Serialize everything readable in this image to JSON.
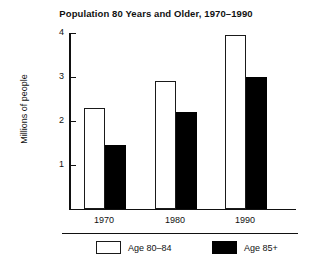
{
  "chart_data": {
    "type": "bar",
    "title": "Population 80 Years and Older, 1970–1990",
    "xlabel": "",
    "ylabel": "Millions of people",
    "categories": [
      "1970",
      "1980",
      "1990"
    ],
    "series": [
      {
        "name": "Age 80–84",
        "values": [
          2.3,
          2.9,
          3.95
        ],
        "color": "#ffffff",
        "edge_color": "#1a1a1a"
      },
      {
        "name": "Age 85+",
        "values": [
          1.45,
          2.2,
          3.0
        ],
        "color": "#000000",
        "edge_color": "#000000"
      }
    ],
    "ylim": [
      0,
      4
    ],
    "yticks": [
      1,
      2,
      3,
      4
    ],
    "ytick_labels": [
      "1",
      "2",
      "3",
      "4"
    ],
    "grid": false,
    "legend_position": "bottom"
  },
  "legend": {
    "entries": [
      {
        "label": "Age 80–84"
      },
      {
        "label": "Age 85+"
      }
    ]
  }
}
